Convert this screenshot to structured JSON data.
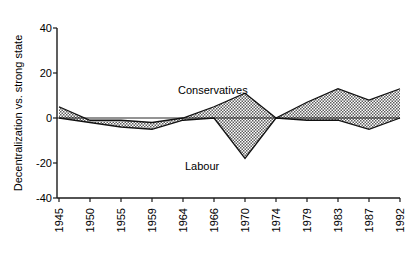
{
  "chart_data": {
    "type": "area",
    "title": "",
    "xlabel": "",
    "ylabel": "Decentralization vs. strong state",
    "categories": [
      "1945",
      "1950",
      "1955",
      "1959",
      "1964",
      "1966",
      "1970",
      "1974",
      "1979",
      "1983",
      "1987",
      "1992"
    ],
    "x": [
      1945,
      1950,
      1955,
      1959,
      1964,
      1966,
      1970,
      1974,
      1979,
      1983,
      1987,
      1992
    ],
    "ylim": [
      -40,
      40
    ],
    "yticks": [
      "40",
      "20",
      "0",
      "-20",
      "-40"
    ],
    "ytick_values": [
      40,
      20,
      0,
      -20,
      -40
    ],
    "grid": false,
    "legend_position": "inline-annotation",
    "series": [
      {
        "name": "Conservatives",
        "values": [
          5,
          -1,
          -1,
          -2,
          0,
          5,
          11,
          0,
          7,
          13,
          8,
          13
        ]
      },
      {
        "name": "Labour",
        "values": [
          0,
          -2,
          -4,
          -5,
          -1,
          0,
          -18,
          0,
          -1,
          -1,
          -5,
          0
        ]
      }
    ],
    "annotations": [
      {
        "text": "Conservatives",
        "x": 1969,
        "y": 22
      },
      {
        "text": "Labour",
        "x": 1970,
        "y": -25
      }
    ],
    "band_fill_color": "#8c8c8c",
    "line_color": "#111111",
    "axis_color": "#1a1a1a",
    "background_color": "#ffffff"
  }
}
